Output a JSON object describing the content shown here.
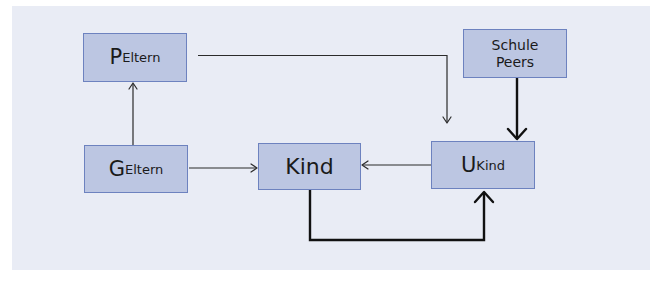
{
  "diagram": {
    "nodes": {
      "p_eltern": {
        "main": "P",
        "sub": "Eltern"
      },
      "g_eltern": {
        "main": "G",
        "sub": "Eltern"
      },
      "kind": {
        "label": "Kind"
      },
      "u_kind": {
        "main": "U",
        "sub": "Kind"
      },
      "schule_peers": {
        "line1": "Schule",
        "line2": "Peers"
      }
    },
    "edges": [
      {
        "from": "g_eltern",
        "to": "p_eltern",
        "weight": "thin"
      },
      {
        "from": "p_eltern",
        "to": "u_kind",
        "weight": "thin"
      },
      {
        "from": "g_eltern",
        "to": "kind",
        "weight": "thin"
      },
      {
        "from": "u_kind",
        "to": "kind",
        "weight": "thin"
      },
      {
        "from": "schule_peers",
        "to": "u_kind",
        "weight": "thick"
      },
      {
        "from": "kind",
        "to": "u_kind",
        "weight": "thick"
      }
    ],
    "colors": {
      "panel_background": "#e9ecf5",
      "node_fill": "#bcc6e2",
      "node_border": "#6d82bf",
      "edge": "#111111"
    }
  }
}
